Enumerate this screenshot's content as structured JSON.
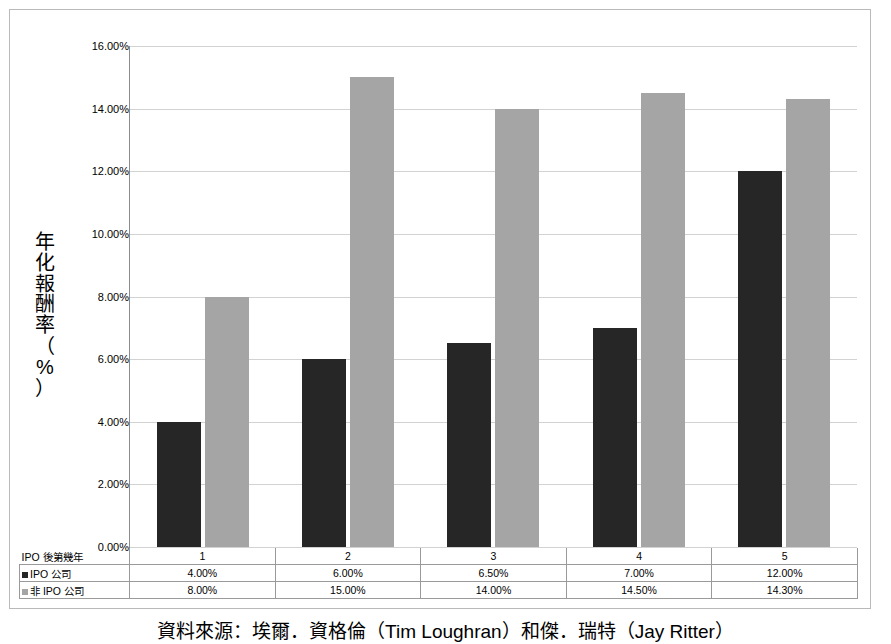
{
  "chart_data": {
    "type": "bar",
    "title": "",
    "xlabel": "IPO 後第幾年",
    "ylabel": "年化報酬率（%）",
    "categories": [
      "1",
      "2",
      "3",
      "4",
      "5"
    ],
    "ylim": [
      0,
      16
    ],
    "ytick_labels": [
      "0.00%",
      "2.00%",
      "4.00%",
      "6.00%",
      "8.00%",
      "10.00%",
      "12.00%",
      "14.00%",
      "16.00%"
    ],
    "ytick_values": [
      0,
      2,
      4,
      6,
      8,
      10,
      12,
      14,
      16
    ],
    "grid": true,
    "legend_position": "table-row-labels",
    "series": [
      {
        "name": "IPO 公司",
        "color": "#262626",
        "values": [
          4.0,
          6.0,
          6.5,
          7.0,
          12.0
        ],
        "labels": [
          "4.00%",
          "6.00%",
          "6.50%",
          "7.00%",
          "12.00%"
        ]
      },
      {
        "name": "非 IPO 公司",
        "color": "#a5a5a5",
        "values": [
          8.0,
          15.0,
          14.0,
          14.5,
          14.3
        ],
        "labels": [
          "8.00%",
          "15.00%",
          "14.00%",
          "14.50%",
          "14.30%"
        ]
      }
    ]
  },
  "axis": {
    "y_title_chars": [
      "年",
      "化",
      "報",
      "酬",
      "率",
      "（",
      "%",
      "）"
    ]
  },
  "table": {
    "row_label_x": "IPO 後第幾年",
    "row_label_series1": "IPO 公司",
    "row_label_series2": "非 IPO 公司"
  },
  "caption": {
    "text": "資料來源：埃爾．資格倫（Tim Loughran）和傑．瑞特（Jay Ritter）"
  }
}
